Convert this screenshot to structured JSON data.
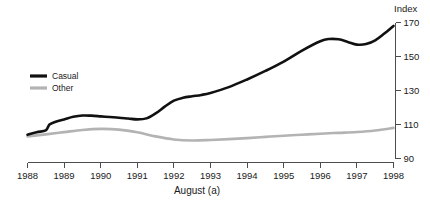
{
  "chart_data": {
    "type": "line",
    "title": "",
    "xlabel": "August (a)",
    "ylabel": "Index",
    "x_tick_labels": [
      "1988",
      "1989",
      "1990",
      "1991",
      "1992",
      "1993",
      "1994",
      "1995",
      "1996",
      "1997",
      "1998"
    ],
    "y_tick_labels": [
      "170",
      "150",
      "130",
      "110",
      "90"
    ],
    "y_ticks": [
      170,
      150,
      130,
      110,
      90
    ],
    "ylim": [
      90,
      170
    ],
    "xlim": [
      1988,
      1998
    ],
    "grid": false,
    "legend_position": "upper-left-inside",
    "series": [
      {
        "name": "Casual",
        "color": "#111111",
        "linewidth": 2.6,
        "x": [
          1988.0,
          1988.25,
          1988.5,
          1988.6,
          1988.75,
          1989.0,
          1989.25,
          1989.5,
          1989.75,
          1990.0,
          1990.25,
          1990.5,
          1990.75,
          1991.0,
          1991.25,
          1991.5,
          1991.75,
          1992.0,
          1992.25,
          1992.5,
          1992.75,
          1993.0,
          1993.5,
          1994.0,
          1994.5,
          1995.0,
          1995.5,
          1996.0,
          1996.25,
          1996.5,
          1996.75,
          1997.0,
          1997.25,
          1997.5,
          1997.75,
          1998.0
        ],
        "y": [
          104.0,
          105.5,
          106.5,
          110.0,
          111.5,
          113.0,
          114.5,
          115.3,
          115.2,
          114.8,
          114.4,
          114.0,
          113.5,
          113.0,
          113.6,
          116.5,
          120.5,
          124.0,
          125.7,
          126.6,
          127.4,
          128.6,
          132.0,
          136.5,
          141.5,
          147.0,
          153.5,
          159.0,
          160.3,
          160.1,
          158.6,
          157.0,
          157.3,
          159.5,
          163.5,
          168.0
        ]
      },
      {
        "name": "Other",
        "color": "#b3b3b3",
        "linewidth": 2.6,
        "x": [
          1988.0,
          1988.5,
          1989.0,
          1989.5,
          1990.0,
          1990.5,
          1991.0,
          1991.5,
          1992.0,
          1992.5,
          1993.0,
          1993.5,
          1994.0,
          1994.5,
          1995.0,
          1995.5,
          1996.0,
          1996.5,
          1997.0,
          1997.5,
          1998.0
        ],
        "y": [
          103.0,
          104.2,
          105.5,
          106.8,
          107.4,
          107.0,
          105.4,
          103.0,
          101.2,
          100.6,
          100.9,
          101.4,
          102.0,
          102.7,
          103.4,
          104.0,
          104.6,
          105.1,
          105.6,
          106.5,
          108.0
        ]
      }
    ]
  },
  "legend": {
    "items": [
      {
        "label": "Casual",
        "color": "#111111"
      },
      {
        "label": "Other",
        "color": "#b3b3b3"
      }
    ]
  },
  "axes": {
    "y_unit_label": "Index",
    "x_axis_title": "August (a)"
  }
}
